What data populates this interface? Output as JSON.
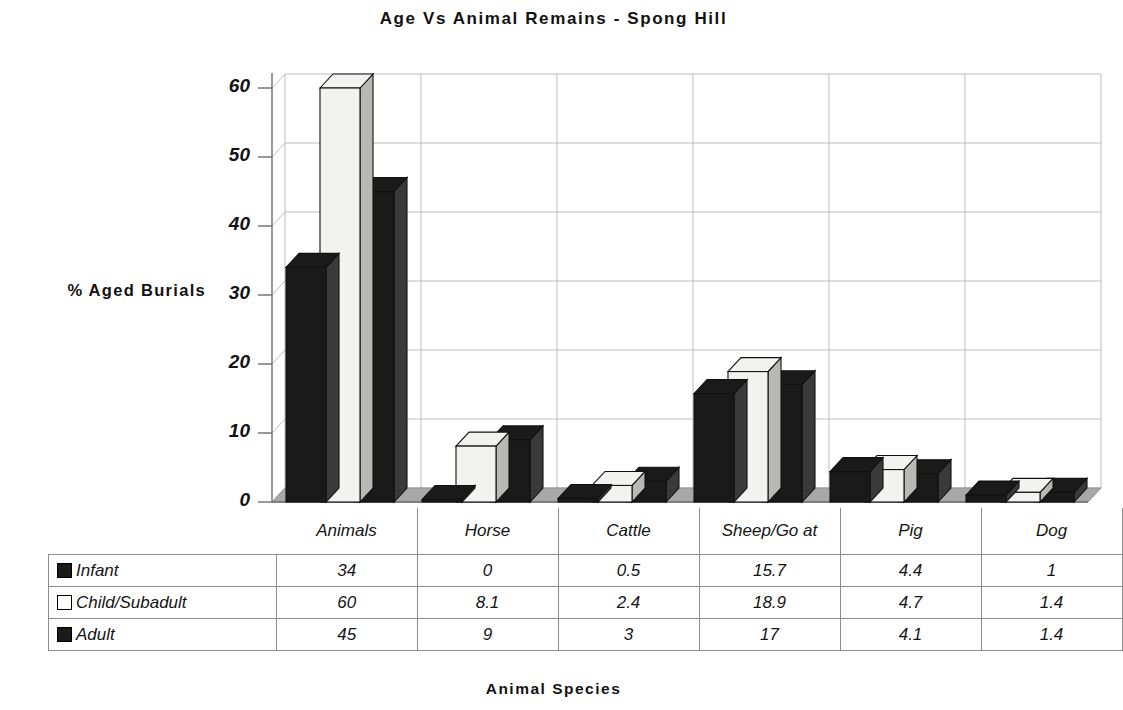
{
  "chart_data": {
    "type": "bar",
    "title": "Age Vs Animal Remains - Spong Hill",
    "xlabel": "Animal Species",
    "ylabel": "% Aged Burials",
    "categories": [
      "Animals",
      "Horse",
      "Cattle",
      "Sheep/Goat",
      "Pig",
      "Dog"
    ],
    "series": [
      {
        "name": "Infant",
        "values": [
          34,
          0,
          0.5,
          15.7,
          4.4,
          1
        ],
        "color": "#1a1a1a",
        "swatch": "filled"
      },
      {
        "name": "Child/Subadult",
        "values": [
          60,
          8.1,
          2.4,
          18.9,
          4.7,
          1.4
        ],
        "color": "#f2f2f0",
        "swatch": "hollow"
      },
      {
        "name": "Adult",
        "values": [
          45,
          9,
          3,
          17,
          4.1,
          1.4
        ],
        "color": "#1a1a1a",
        "swatch": "filled"
      }
    ],
    "ylim": [
      0,
      60
    ],
    "yticks": [
      0,
      10,
      20,
      30,
      40,
      50,
      60
    ],
    "ytick_labels": [
      "0",
      "10",
      "20",
      "30",
      "40",
      "50",
      "60"
    ],
    "grid": true,
    "legend_position": "data-table-below",
    "style": "3d-column"
  },
  "table": {
    "header_labels": [
      "Animals",
      "Horse",
      "Cattle",
      "Sheep/Go at",
      "Pig",
      "Dog"
    ],
    "rows": [
      {
        "label": "Infant",
        "swatch": "filled",
        "cells": [
          "34",
          "0",
          "0.5",
          "15.7",
          "4.4",
          "1"
        ]
      },
      {
        "label": "Child/Subadult",
        "swatch": "hollow",
        "cells": [
          "60",
          "8.1",
          "2.4",
          "18.9",
          "4.7",
          "1.4"
        ]
      },
      {
        "label": "Adult",
        "swatch": "filled",
        "cells": [
          "45",
          "9",
          "3",
          "17",
          "4.1",
          "1.4"
        ]
      }
    ]
  },
  "colors": {
    "bar_dark": "#1a1a1a",
    "bar_light": "#f2f2f0",
    "side_dark": "#3a3a3a",
    "side_light": "#b8b8b4",
    "floor": "#a8a8a8",
    "floor_edge": "#8f8f8f",
    "grid": "#bdbdbd",
    "axis": "#6e6e6e",
    "text": "#121212"
  }
}
